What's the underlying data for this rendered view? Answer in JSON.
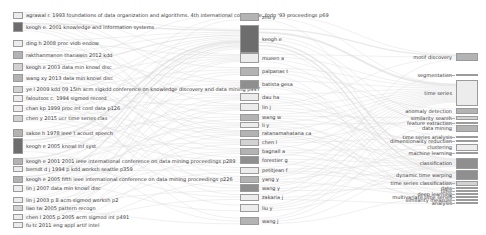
{
  "figure": {
    "description_label": "publication-author-topic sankey",
    "background": "#ffffff"
  },
  "chart_data": {
    "type": "sankey",
    "title": "",
    "legend": "none",
    "colors": {
      "light": "#ececec",
      "midlight": "#d2d2d2",
      "mid": "#b3b3b3",
      "darkmid": "#8f8f8f",
      "dark": "#6d6d6d",
      "flow": "#dadada",
      "label": "#3a3a3a"
    },
    "columns": [
      {
        "id": "publications",
        "nodes": [
          {
            "label": "agrawal r. 1993 foundations of data organization and algorithms. 4th international conference. fodo '93 proceedings p69",
            "y": 15,
            "h": 7,
            "shade": "light"
          },
          {
            "label": "keogh e. 2001 knowledge and information systems",
            "y": 27,
            "h": 10,
            "shade": "dark"
          },
          {
            "label": "ding h 2008 proc vldb endow",
            "y": 43,
            "h": 7,
            "shade": "light"
          },
          {
            "label": "rakthanmanon thanawin 2012 kdd",
            "y": 55,
            "h": 8,
            "shade": "mid"
          },
          {
            "label": "keogh e 2003 data min knowl disc",
            "y": 67,
            "h": 8,
            "shade": "midlight"
          },
          {
            "label": "wang xy 2013 data min knowl disc",
            "y": 78,
            "h": 8,
            "shade": "mid"
          },
          {
            "label": "ye l 2009 kdd 09 15th acm sigkdd conference on knowledge discovery and data mining p947",
            "y": 89,
            "h": 7,
            "shade": "midlight"
          },
          {
            "label": "faloutsos c. 1994 sigmod record",
            "y": 98,
            "h": 7,
            "shade": "light"
          },
          {
            "label": "chan kp 1999 proc int conf data p126",
            "y": 108,
            "h": 7,
            "shade": "light"
          },
          {
            "label": "chen y 2015 ucr time series clas",
            "y": 118,
            "h": 7,
            "shade": "midlight"
          },
          {
            "label": "sakoe h 1978 ieee t acoust speech",
            "y": 133,
            "h": 8,
            "shade": "mid"
          },
          {
            "label": "keogh e 2005 knowl inf syst",
            "y": 146,
            "h": 16,
            "shade": "dark"
          },
          {
            "label": "keogh e 2001 2001 ieee international conference on data mining proceedings p289",
            "y": 161,
            "h": 7,
            "shade": "mid"
          },
          {
            "label": "berndt d j 1994 p kdd worksh seattle p359",
            "y": 169,
            "h": 6,
            "shade": "light"
          },
          {
            "label": "keogh e 2005 fifth ieee international conference on data mining proceedings p226",
            "y": 179,
            "h": 7,
            "shade": "mid"
          },
          {
            "label": "lin j 2007 data min knowl disc",
            "y": 188,
            "h": 7,
            "shade": "light"
          },
          {
            "label": "lin j 2003 p 8 acm sigmod worksh p2",
            "y": 200,
            "h": 6,
            "shade": "light"
          },
          {
            "label": "liao tw 2005 pattern recogn",
            "y": 208,
            "h": 6,
            "shade": "midlight"
          },
          {
            "label": "chen l 2005 p 2005 acm sigmod int p491",
            "y": 217,
            "h": 6,
            "shade": "light"
          },
          {
            "label": "fu tc 2011 eng appl artif intel",
            "y": 225,
            "h": 6,
            "shade": "light"
          }
        ]
      },
      {
        "id": "authors",
        "nodes": [
          {
            "label": "zhu y",
            "y": 17,
            "h": 8,
            "shade": "mid"
          },
          {
            "label": "keogh e",
            "y": 39,
            "h": 28,
            "shade": "dark"
          },
          {
            "label": "mueen a",
            "y": 58,
            "h": 10,
            "shade": "light"
          },
          {
            "label": "palpanas t",
            "y": 71,
            "h": 9,
            "shade": "mid"
          },
          {
            "label": "batista gesa",
            "y": 84,
            "h": 9,
            "shade": "darkmid"
          },
          {
            "label": "dau ha",
            "y": 97,
            "h": 8,
            "shade": "light"
          },
          {
            "label": "lin j",
            "y": 107,
            "h": 8,
            "shade": "light"
          },
          {
            "label": "wang w",
            "y": 117,
            "h": 7,
            "shade": "mid"
          },
          {
            "label": "li y",
            "y": 125,
            "h": 6,
            "shade": "light"
          },
          {
            "label": "ratanamahatana ca",
            "y": 133,
            "h": 7,
            "shade": "mid"
          },
          {
            "label": "chen l",
            "y": 142,
            "h": 7,
            "shade": "midlight"
          },
          {
            "label": "bagnall a",
            "y": 151,
            "h": 7,
            "shade": "mid"
          },
          {
            "label": "forestier g",
            "y": 160,
            "h": 8,
            "shade": "darkmid"
          },
          {
            "label": "petitjean f",
            "y": 170,
            "h": 7,
            "shade": "light"
          },
          {
            "label": "yang y",
            "y": 179,
            "h": 7,
            "shade": "mid"
          },
          {
            "label": "wang y",
            "y": 188,
            "h": 8,
            "shade": "darkmid"
          },
          {
            "label": "zakaria j",
            "y": 197,
            "h": 7,
            "shade": "light"
          },
          {
            "label": "liu y",
            "y": 208,
            "h": 8,
            "shade": "light"
          },
          {
            "label": "wang j",
            "y": 221,
            "h": 8,
            "shade": "mid"
          }
        ]
      },
      {
        "id": "topics",
        "nodes": [
          {
            "label": "motif discovery",
            "y": 57,
            "h": 8,
            "shade": "mid"
          },
          {
            "label": "segmentation",
            "y": 75,
            "h": 2,
            "shade": "midlight"
          },
          {
            "label": "time series",
            "y": 93,
            "h": 26,
            "shade": "light"
          },
          {
            "label": "anomaly detection",
            "y": 111,
            "h": 6,
            "shade": "mid"
          },
          {
            "label": "similarity search",
            "y": 118,
            "h": 4,
            "shade": "midlight"
          },
          {
            "label": "feature extraction",
            "y": 123,
            "h": 2,
            "shade": "midlight"
          },
          {
            "label": "data mining",
            "y": 128,
            "h": 7,
            "shade": "mid"
          },
          {
            "label": "time series analysis",
            "y": 137,
            "h": 2,
            "shade": "midlight"
          },
          {
            "label": "dimensionality reduction",
            "y": 141,
            "h": 2,
            "shade": "midlight"
          },
          {
            "label": "clustering",
            "y": 147,
            "h": 7,
            "shade": "light"
          },
          {
            "label": "machine learning",
            "y": 153,
            "h": 2,
            "shade": "midlight"
          },
          {
            "label": "classification",
            "y": 163,
            "h": 11,
            "shade": "darkmid"
          },
          {
            "label": "dynamic time warping",
            "y": 175,
            "h": 10,
            "shade": "darkmid"
          },
          {
            "label": "time series classification",
            "y": 183,
            "h": 5,
            "shade": "midlight"
          },
          {
            "label": "data",
            "y": 188,
            "h": 2,
            "shade": "midlight"
          },
          {
            "label": "time",
            "y": 191,
            "h": 2,
            "shade": "midlight"
          },
          {
            "label": "deep learning",
            "y": 194,
            "h": 2,
            "shade": "midlight"
          },
          {
            "label": "multivariate time series",
            "y": 197,
            "h": 2,
            "shade": "midlight"
          },
          {
            "label": "similarity measure",
            "y": 200,
            "h": 2,
            "shade": "midlight"
          },
          {
            "label": "analysis",
            "y": 203,
            "h": 2,
            "shade": "midlight"
          }
        ]
      }
    ],
    "links": {
      "left_mid": [
        [
          0,
          1
        ],
        [
          0,
          2
        ],
        [
          0,
          4
        ],
        [
          0,
          10
        ],
        [
          1,
          1,
          1.5
        ],
        [
          1,
          3
        ],
        [
          1,
          6
        ],
        [
          1,
          9
        ],
        [
          1,
          14
        ],
        [
          2,
          1
        ],
        [
          2,
          2
        ],
        [
          2,
          5
        ],
        [
          2,
          8
        ],
        [
          3,
          1
        ],
        [
          3,
          4
        ],
        [
          3,
          7
        ],
        [
          3,
          15
        ],
        [
          4,
          0
        ],
        [
          4,
          1,
          1.2
        ],
        [
          4,
          9
        ],
        [
          4,
          11
        ],
        [
          5,
          2
        ],
        [
          5,
          5
        ],
        [
          5,
          10
        ],
        [
          5,
          16
        ],
        [
          6,
          1
        ],
        [
          6,
          3
        ],
        [
          6,
          8
        ],
        [
          6,
          18
        ],
        [
          7,
          1
        ],
        [
          7,
          6
        ],
        [
          7,
          12
        ],
        [
          7,
          17
        ],
        [
          8,
          2
        ],
        [
          8,
          4
        ],
        [
          8,
          9
        ],
        [
          8,
          13
        ],
        [
          9,
          1
        ],
        [
          9,
          5
        ],
        [
          9,
          11
        ],
        [
          9,
          14
        ],
        [
          10,
          0
        ],
        [
          10,
          3
        ],
        [
          10,
          7
        ],
        [
          10,
          12
        ],
        [
          10,
          15
        ],
        [
          11,
          1,
          2
        ],
        [
          11,
          2
        ],
        [
          11,
          6
        ],
        [
          11,
          10
        ],
        [
          11,
          18
        ],
        [
          12,
          1,
          1.5
        ],
        [
          12,
          4
        ],
        [
          12,
          8
        ],
        [
          12,
          16
        ],
        [
          13,
          1
        ],
        [
          13,
          5
        ],
        [
          13,
          9
        ],
        [
          13,
          13
        ],
        [
          14,
          1,
          1.3
        ],
        [
          14,
          7
        ],
        [
          14,
          11
        ],
        [
          14,
          17
        ],
        [
          15,
          0
        ],
        [
          15,
          2
        ],
        [
          15,
          6
        ],
        [
          15,
          12
        ],
        [
          16,
          1
        ],
        [
          16,
          3
        ],
        [
          16,
          10
        ],
        [
          16,
          15
        ],
        [
          17,
          4
        ],
        [
          17,
          8
        ],
        [
          17,
          13
        ],
        [
          17,
          18
        ],
        [
          18,
          1
        ],
        [
          18,
          5
        ],
        [
          18,
          9
        ],
        [
          18,
          16
        ],
        [
          19,
          2
        ],
        [
          19,
          6
        ],
        [
          19,
          11
        ],
        [
          19,
          14
        ]
      ],
      "mid_right": [
        [
          0,
          0
        ],
        [
          0,
          2
        ],
        [
          0,
          12
        ],
        [
          1,
          0,
          1.3
        ],
        [
          1,
          2,
          2
        ],
        [
          1,
          4
        ],
        [
          1,
          6
        ],
        [
          1,
          11,
          1.5
        ],
        [
          1,
          12,
          1.5
        ],
        [
          1,
          13
        ],
        [
          2,
          0
        ],
        [
          2,
          2
        ],
        [
          2,
          5
        ],
        [
          2,
          12
        ],
        [
          3,
          2
        ],
        [
          3,
          3
        ],
        [
          3,
          7
        ],
        [
          3,
          19
        ],
        [
          4,
          2
        ],
        [
          4,
          11
        ],
        [
          4,
          12
        ],
        [
          4,
          13
        ],
        [
          5,
          2
        ],
        [
          5,
          9
        ],
        [
          5,
          11
        ],
        [
          5,
          13
        ],
        [
          6,
          0
        ],
        [
          6,
          2
        ],
        [
          6,
          6
        ],
        [
          6,
          9
        ],
        [
          7,
          2
        ],
        [
          7,
          4
        ],
        [
          7,
          8
        ],
        [
          7,
          15
        ],
        [
          8,
          2
        ],
        [
          8,
          5
        ],
        [
          8,
          11
        ],
        [
          8,
          16
        ],
        [
          9,
          2
        ],
        [
          9,
          11
        ],
        [
          9,
          12
        ],
        [
          9,
          13
        ],
        [
          10,
          2
        ],
        [
          10,
          4
        ],
        [
          10,
          7
        ],
        [
          10,
          18
        ],
        [
          11,
          2
        ],
        [
          11,
          9
        ],
        [
          11,
          11
        ],
        [
          11,
          13
        ],
        [
          12,
          2
        ],
        [
          12,
          11
        ],
        [
          12,
          13
        ],
        [
          12,
          17
        ],
        [
          13,
          2
        ],
        [
          13,
          11
        ],
        [
          13,
          12
        ],
        [
          13,
          13
        ],
        [
          14,
          1
        ],
        [
          14,
          2
        ],
        [
          14,
          10
        ],
        [
          14,
          16
        ],
        [
          15,
          2
        ],
        [
          15,
          3
        ],
        [
          15,
          11
        ],
        [
          15,
          14
        ],
        [
          16,
          0
        ],
        [
          16,
          2
        ],
        [
          16,
          12
        ],
        [
          16,
          19
        ],
        [
          17,
          2
        ],
        [
          17,
          5
        ],
        [
          17,
          8
        ],
        [
          17,
          11
        ],
        [
          18,
          2
        ],
        [
          18,
          6
        ],
        [
          18,
          11
        ],
        [
          18,
          17
        ]
      ]
    },
    "layout": {
      "width": 486,
      "height": 235,
      "left_box_x": 13,
      "left_box_w": 10,
      "mid_box_x": 240,
      "mid_box_w": 19,
      "right_box_x": 456,
      "right_box_w": 22
    }
  }
}
